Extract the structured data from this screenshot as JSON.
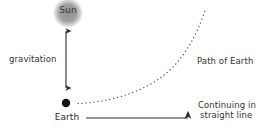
{
  "diagram": {
    "title": "Gravitation and the orbital path of Earth around the Sun",
    "background_color": "#ffffff",
    "ink_color": "#2b2b2b",
    "sun_color": "#9a9a9a",
    "earth_color": "#141414",
    "bodies": {
      "sun": {
        "label": "Sun",
        "center_x": 68,
        "center_y": 13,
        "radius": 15,
        "fill": "#9a9a9a",
        "style": "soft blurred gray disc"
      },
      "earth": {
        "label": "Earth",
        "center_x": 66,
        "center_y": 103,
        "radius": 4,
        "fill": "#141414",
        "style": "solid black dot"
      }
    },
    "arrows": {
      "gravitation": {
        "label": "gravitation",
        "kind": "double-headed vertical arrow",
        "x": 66,
        "y_top": 26,
        "y_bottom": 93
      },
      "straight_line": {
        "label_line1": "Continuing in",
        "label_line2": "straight line",
        "kind": "single-headed horizontal arrow",
        "y": 118,
        "x_start": 86,
        "x_end": 195
      }
    },
    "curve": {
      "label": "Path of Earth",
      "kind": "dotted curve",
      "start_x": 78,
      "start_y": 103,
      "end_x": 205,
      "end_y": 9,
      "dot_spacing": 4
    }
  }
}
